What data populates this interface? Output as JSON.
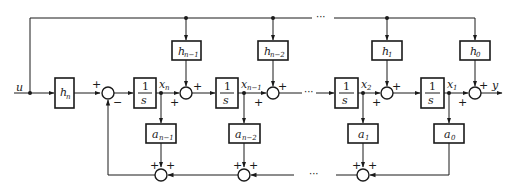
{
  "diagram": {
    "type": "state-space block diagram (observable canonical form with direct feedthrough)",
    "input_label": "u",
    "output_label": "y",
    "input_gain": {
      "base": "h",
      "sub": "n"
    },
    "integrator": {
      "num": "1",
      "den": "s"
    },
    "feedforward_gains": [
      {
        "base": "h",
        "sub": "n−1"
      },
      {
        "base": "h",
        "sub": "n−2"
      },
      {
        "base": "h",
        "sub": "1"
      },
      {
        "base": "h",
        "sub": "0"
      }
    ],
    "feedback_gains": [
      {
        "base": "a",
        "sub": "n−1"
      },
      {
        "base": "a",
        "sub": "n−2"
      },
      {
        "base": "a",
        "sub": "1"
      },
      {
        "base": "a",
        "sub": "0"
      }
    ],
    "states": [
      {
        "base": "x",
        "sub": "n"
      },
      {
        "base": "x",
        "sub": "n−1"
      },
      {
        "base": "x",
        "sub": "2"
      },
      {
        "base": "x",
        "sub": "1"
      }
    ],
    "signs": {
      "plus": "+",
      "minus": "−"
    },
    "ellipsis": "···"
  }
}
